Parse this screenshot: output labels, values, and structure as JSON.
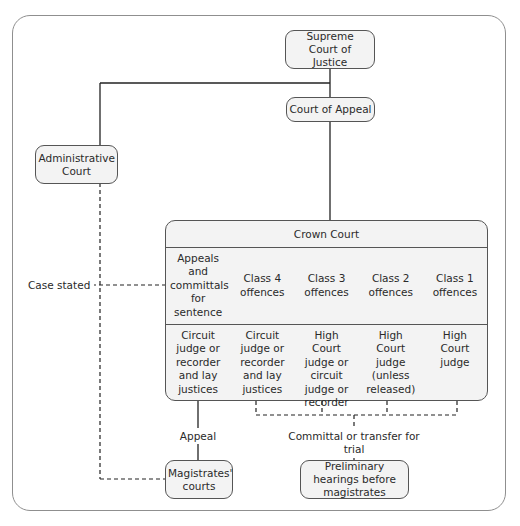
{
  "diagram": {
    "nodes": {
      "supreme_court": "Supreme Court of Justice",
      "court_of_appeal": "Court of Appeal",
      "administrative_court": "Administrative Court",
      "magistrates_courts": "Magistrates' courts",
      "preliminary_hearings": "Preliminary hearings before magistrates"
    },
    "crown_court": {
      "title": "Crown Court",
      "business": [
        "Appeals and committals for sentence",
        "Class 4 offences",
        "Class 3 offences",
        "Class 2 offences",
        "Class 1 offences"
      ],
      "judges": [
        "Circuit judge or recorder and lay justices",
        "Circuit judge or recorder and lay justices",
        "High Court judge or circuit judge or recorder",
        "High Court judge (unless released)",
        "High Court judge"
      ]
    },
    "edge_labels": {
      "case_stated": "Case stated",
      "appeal": "Appeal",
      "committal": "Committal or transfer for trial"
    }
  }
}
